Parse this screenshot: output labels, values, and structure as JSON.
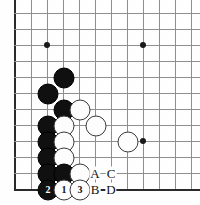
{
  "figure": {
    "caption": "",
    "board": {
      "grid_spacing_px": 16,
      "x_lines": [
        15,
        31,
        47,
        63,
        79,
        95,
        111,
        127,
        143,
        159,
        175,
        191
      ],
      "y_lines": [
        13,
        29,
        45,
        61,
        77,
        93,
        109,
        125,
        141,
        157,
        173,
        189
      ],
      "left_edge_x": 15,
      "bottom_edge_y": 189,
      "line_color": "#8f8f8f",
      "edge_color": "#2a2a2a",
      "board_color": "#fefefe"
    },
    "star_points": [
      {
        "x": 47,
        "y": 45
      },
      {
        "x": 143,
        "y": 45
      },
      {
        "x": 143,
        "y": 141
      }
    ],
    "stones": [
      {
        "color": "black",
        "x": 63,
        "y": 77,
        "label": ""
      },
      {
        "color": "black",
        "x": 47,
        "y": 93,
        "label": ""
      },
      {
        "color": "black",
        "x": 63,
        "y": 109,
        "label": ""
      },
      {
        "color": "white",
        "x": 79,
        "y": 109,
        "label": ""
      },
      {
        "color": "black",
        "x": 47,
        "y": 125,
        "label": ""
      },
      {
        "color": "white",
        "x": 63,
        "y": 125,
        "label": ""
      },
      {
        "color": "white",
        "x": 95,
        "y": 125,
        "label": ""
      },
      {
        "color": "black",
        "x": 47,
        "y": 141,
        "label": ""
      },
      {
        "color": "white",
        "x": 63,
        "y": 141,
        "label": ""
      },
      {
        "color": "white",
        "x": 127,
        "y": 141,
        "label": ""
      },
      {
        "color": "black",
        "x": 47,
        "y": 157,
        "label": ""
      },
      {
        "color": "white",
        "x": 63,
        "y": 157,
        "label": ""
      },
      {
        "color": "black",
        "x": 47,
        "y": 173,
        "label": ""
      },
      {
        "color": "black",
        "x": 63,
        "y": 173,
        "label": ""
      },
      {
        "color": "white",
        "x": 79,
        "y": 173,
        "label": ""
      },
      {
        "color": "black",
        "x": 47,
        "y": 189,
        "label": "2"
      },
      {
        "color": "white",
        "x": 63,
        "y": 189,
        "label": "1"
      },
      {
        "color": "white",
        "x": 79,
        "y": 189,
        "label": "3"
      }
    ],
    "point_labels": [
      {
        "text": "A",
        "x": 95,
        "y": 173
      },
      {
        "text": "C",
        "x": 111,
        "y": 173
      },
      {
        "text": "B",
        "x": 95,
        "y": 189
      },
      {
        "text": "D",
        "x": 111,
        "y": 189
      }
    ],
    "move_numbers": [
      "1",
      "2",
      "3"
    ],
    "colors": {
      "black_stone": "#101010",
      "white_stone": "#fdfdfd",
      "stone_outline": "#3a3a3a",
      "label_text": "#111111"
    }
  }
}
